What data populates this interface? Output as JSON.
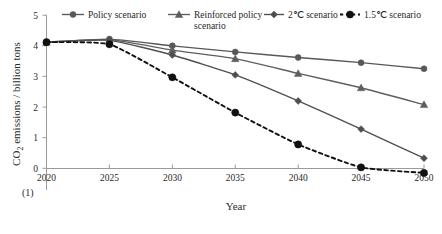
{
  "figure": {
    "number_label": "(1)",
    "xlabel": "Year",
    "ylabel_main": "CO",
    "ylabel_sub": "2",
    "ylabel_rest": " emissions / billion tons"
  },
  "chart_data": {
    "type": "line",
    "title": "",
    "xlabel": "Year",
    "ylabel": "CO2 emissions / billion tons",
    "x": [
      2020,
      2025,
      2030,
      2035,
      2040,
      2045,
      2050
    ],
    "xlim": [
      2020,
      2050
    ],
    "ylim": [
      0,
      5
    ],
    "xticks": [
      "2020",
      "2025",
      "2030",
      "2035",
      "2040",
      "2045",
      "2050"
    ],
    "yticks": [
      "0",
      "1",
      "2",
      "3",
      "4",
      "5"
    ],
    "grid": false,
    "legend_position": "top",
    "series": [
      {
        "name": "Policy scenario",
        "marker": "circle",
        "linestyle": "solid",
        "color": "#585858",
        "values": [
          4.12,
          4.22,
          4.0,
          3.8,
          3.62,
          3.45,
          3.25
        ]
      },
      {
        "name": "Reinforced policy scenario",
        "marker": "triangle",
        "linestyle": "solid",
        "color": "#5e5e5e",
        "values": [
          4.12,
          4.2,
          3.86,
          3.58,
          3.1,
          2.63,
          2.08
        ]
      },
      {
        "name": "2℃ scenario",
        "marker": "diamond",
        "linestyle": "solid",
        "color": "#4f4f4f",
        "values": [
          4.12,
          4.18,
          3.7,
          3.05,
          2.2,
          1.28,
          0.33
        ]
      },
      {
        "name": "1.5℃ scenario",
        "marker": "filled-circle",
        "linestyle": "dashed",
        "color": "#111111",
        "values": [
          4.12,
          4.05,
          2.97,
          1.82,
          0.78,
          0.03,
          -0.15
        ]
      }
    ]
  },
  "legend": {
    "items": [
      {
        "label": "Policy scenario",
        "marker": "circle",
        "linestyle": "solid"
      },
      {
        "label": "Reinforced policy",
        "label2": "scenario",
        "marker": "triangle",
        "linestyle": "solid"
      },
      {
        "label": "2℃ scenario",
        "marker": "diamond",
        "linestyle": "solid"
      },
      {
        "label": "1.5℃ scenario",
        "marker": "filled-circle",
        "linestyle": "dashed"
      }
    ]
  }
}
